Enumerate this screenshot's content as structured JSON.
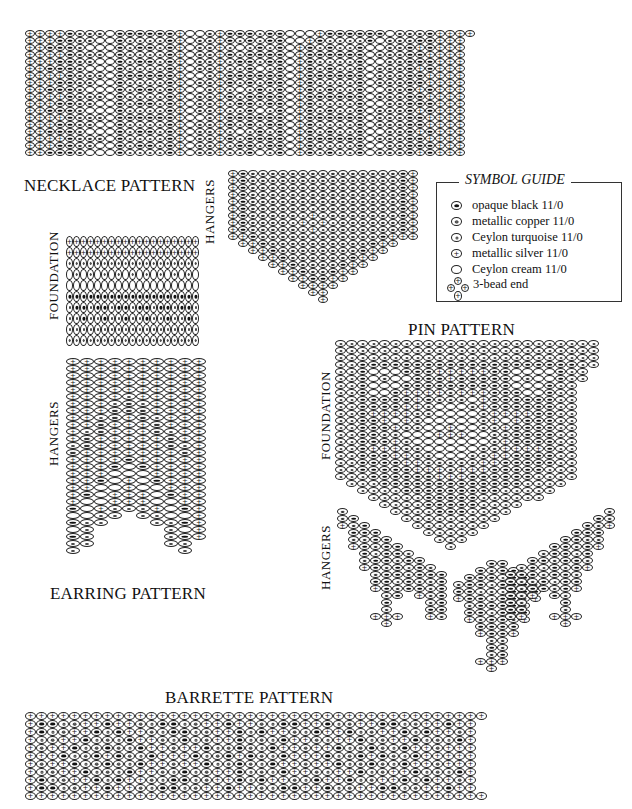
{
  "titles": {
    "necklace": "NECKLACE PATTERN",
    "earring": "EARRING PATTERN",
    "pin": "PIN PATTERN",
    "barrette": "BARRETTE PATTERN"
  },
  "side_labels": {
    "necklace_hangers": "HANGERS",
    "earring_foundation": "FOUNDATION",
    "earring_hangers": "HANGERS",
    "pin_foundation": "FOUNDATION",
    "pin_hangers": "HANGERS"
  },
  "symbol_guide": {
    "title": "SYMBOL GUIDE",
    "items": [
      {
        "code": "B",
        "label": "opaque black 11/0"
      },
      {
        "code": "C",
        "label": "metallic copper 11/0"
      },
      {
        "code": "T",
        "label": "Ceylon turquoise 11/0"
      },
      {
        "code": "S",
        "label": "metallic silver 11/0"
      },
      {
        "code": "W",
        "label": "Ceylon cream 11/0"
      },
      {
        "code": "END3",
        "label": "3-bead end"
      }
    ]
  },
  "patterns": {
    "necklace": {
      "x": 25,
      "y": 30,
      "bw": 10,
      "bh": 7,
      "rows": [
        "SSSSBCCCWBBBBBBSWWCSBBBTBBWWWSBBBBBBWCCCBSSSS",
        "SSSBBCCWWBTTTTBSWCCSBTBTBBWWSBTTTTBWCCCBBSSS",
        "SSBBBCWWWBTBBTBSWCCSTWTBTBWSBTBTTBWWCCBSBSSS",
        "SSSSBCCCWBTTTTBSWCCSBTBBBBWSBBBBBBWCCCBBSSSS",
        "SSSBBCCWWBTBBTBSWCCSTBBTBBWSBTTTTBWWCCBBBSSS",
        "SSBBBCWWWBTTTTBSWCCSTTBWTBWSBTBTTBWCCCBSBSSS",
        "SSSSBCCCWBBBBBBSWWCSBBBBBBWSBBBBBBWCCCBBSSSS",
        "SSSBBCCWWBTTTTBSWCCSBTBTBBWSBTTTTBWCCCBBSSSS",
        "SSBBBCWWWBTBBTBSWWCSTWTBTBWSBTBTTBWWCCBSBSSS",
        "SSSSBCCCWBTTTTBSWCCSBTBBBBWSBBBBBBWCCCBBSSSS",
        "SSSBBCCWWBTBBTBSWCCSTBBTBBWSBTTTTBWWCCBBBSSS",
        "SSBBBCWWWBTTTTBSWCCSTTBWTBWSBTBTTBWCCCBSBSSS",
        "SSSSBCCCWBBBBBBSWWCSBBBBBBWSBBBBBBWCCCBBSSSS",
        "SSSBBCCWWBTTTTBSWCCSBTBTBBWSBTTTTBWCCCBBSSSS",
        "SSBBBCWWWBTBBTBSWCCSTWTBTBWSBTBTTBWWCCBSBSSS",
        "SSSSBCCCWBTTTTBSWCCSBTBBBBWSBBBBBBWCCCBBSSSS",
        "SSSBBCCWWBTBBTBSWCCSTBBTBBWSBTTTTBWWCCBBBSSS",
        "SSBBBCWWWBTTTTBSWCCSTTBWTBWSBTBTTBWCCCBSBSSS"
      ]
    },
    "necklace_hangers": {
      "x": 228,
      "y": 170,
      "bw": 10,
      "bh": 7,
      "rows": [
        "SBCCCCCCCCCCCCCCCBS",
        "SBCCCCCCCCCCCCCCCBS",
        "SBCCCCCCCCCCCCCCCBS",
        "SBCCCCCCCCCCCCCCCBS",
        "SBCCCCCCCCCCCCCCCBS",
        "SBCCCCCCTCCCCCCCCBS",
        "SBCCCCCTSTCCCCCCCBS",
        "SBCCCCTSTSTCCCCCCBS",
        "SBCCCCCTSTCCCCCCCBS",
        "SSBCCCCCTCCCCCCBSSS",
        ".SSBCCCCCCCCCCBSS..",
        "..SSBCCCCCCCCBSS...",
        "...SSBCCCCCCBSS....",
        "....SSBCCCCBSS.....",
        ".....SSBCCBSS......",
        "......SSBBSS.......",
        ".......SSSS........",
        "........SS.........",
        ".........S........."
      ]
    },
    "earring_foundation": {
      "x": 66,
      "y": 236,
      "bw": 7,
      "bh": 11,
      "rows": [
        "SSSSSSSSSSSSSSSSSSS",
        "SSSSSSSSSSSSSSSSSSS",
        "CCCCCCCCCCCCCCCCCCC",
        "WCWCWCWCWCWCWCWCWCW",
        "WWWWWWWWWWWWWWWWWWW",
        "BBBBBBBBBBBBBBBBBBB",
        "TBBTBBTBBTBBTBBTBBT",
        "TTBTTBTTBTTBTTBTTBT",
        "TTTTTTTTTTTTTTTTTTT",
        "CCCCCCCCCCCCCCCCCCC"
      ]
    },
    "earring_hangers": {
      "x": 66,
      "y": 358,
      "bw": 14,
      "bh": 7,
      "rows": [
        "SSSSSSSSSS",
        "SSSSSSSSSS",
        "SSSSSSSSSS",
        "SSSSSSSSSS",
        "SSSSSSSSSS",
        "SSSSTSSSSS",
        "SSSTCTSSSS",
        "SSSCCCSSSS",
        "SSTCSCTSSS",
        "SSCSSSCSSS",
        "STCSSSCTSS",
        "SCSSSSSCSS",
        "TCSSSSSCTS",
        "CSSSSSSSCS",
        "SSSSBSSSSS",
        "SSSBWBSSSS",
        "SSSWWWSSSS",
        "SSBWSWBSSS",
        "SSWWSWWSSS",
        "SBWSSSWBSS",
        "SWWSSSWWSS",
        "BWSTTTSWBS",
        "WWTT.TTWWS",
        "BTT...TTBS",
        "WT.....TWS",
        "BT.....TBS",
        "TT.....TT.",
        "T.......T."
      ]
    },
    "pin_foundation": {
      "x": 335,
      "y": 340,
      "bw": 11,
      "bh": 7,
      "rows": [
        "TTTTTTTTTTTTTTTTTTTTTTTT",
        "TTTTTTTTTTTTTTTTTTTTTTTT",
        "TTTTTTTTTTTTTTTTTTTTTTTT",
        "TTBBBBBBBBBBBBBBBBBBBBTT",
        "TTBWWWBBBSSSSSBBWWWWBTT",
        "TTBWCWWBBBSBBBBBWCWWBTT",
        "TTBWWWBBBBBBBBBBWWWBTT",
        "TTBWWBSSSSCSSSBBBWWBTT",
        "TTBBBBBSBCCCWSBBBBBBTT",
        "TTBBBBSSCWWWCSBBBBBBTT",
        "TTBSSSSCCWWWWCSSSSBBTT",
        "TTBBSWSCWWWWWCSWSBBBTT",
        "TTBBBSCCWWSWWCCSBBBBTT",
        "TTBBCCWWWSSSWWCCBBBBTT",
        "TTBBBSCWWWWWWWCSBBBBTT",
        "TTBSSSCCWWWWWCCSSSSBTT",
        "TTBBBSSCCWWWCCSSBBBBTT",
        "TTBBBBSSCCCCCSSBBBBBTT",
        "TTBBBBBSSSCSSSBBBBBTTT",
        "TTTBBBBBBSSSBBBBBBTTTT",
        ".TTTBBBBBBBBBBBBBTTTT.",
        "..TTTTBBBBBBBBBTTTTT..",
        "...TTTTTBBBBBTTTTTT...",
        "....TTTTBBBBBTTTT.....",
        ".....TTTTBBBTTTT......",
        "......TTTTTTTTT.......",
        ".......TTTTTTT........",
        "........TTTTT.........",
        ".........TTT..........",
        "..........T..........."
      ]
    },
    "pin_hangers_left": {
      "x": 337,
      "y": 508,
      "bw": 11,
      "bh": 7,
      "rows": [
        "C.........",
        "CB........",
        "SCB.......",
        ".BBB......",
        ".CCBB.....",
        ".SBCBB....",
        "..BTBBC...",
        "..CBBCBB..",
        "..SBCBTBC.",
        "...CBBCBBB",
        "...BBTBCCB",
        "...SBCBBCB",
        "....CB.SCB",
        "....B...CB",
        "....C...BB",
        "...SSS..SC",
        "....S....."
      ]
    },
    "pin_hangers_center": {
      "x": 420,
      "y": 560,
      "bw": 11,
      "bh": 7,
      "rows": [
        "......BB......",
        ".....BCBB.....",
        "....BBBTBB....",
        "...CBBTBBBC...",
        "...BBTCTBBB...",
        "...SBBTBBCS...",
        "....CBBBBC....",
        "....BBTBBB....",
        "....SCBBCS....",
        ".....BBBB.....",
        ".....SBBS.....",
        "......CC......",
        "......BC......",
        "......CB......",
        ".....SSS......",
        "......S......."
      ]
    },
    "pin_hangers_right": {
      "x": 505,
      "y": 508,
      "bw": 11,
      "bh": 7,
      "rows": [
        ".........C",
        "........BC",
        ".......BCS",
        "......BBB.",
        ".....BBCC.",
        "....BBCBS.",
        "...CBBTB..",
        "..BBCBBC..",
        ".CBTBCBS..",
        "BBBCBBC...",
        "BCCBTBB...",
        "BCBBCBS...",
        "BCS.BC....",
        "BC...B....",
        "BB...C....",
        "CS..SSS...",
        ".....S...."
      ]
    },
    "barrette": {
      "x": 25,
      "y": 712,
      "bw": 11,
      "bh": 8,
      "rows": [
        "SSSSSSSSSSSSSSSSSSSSSSSSSSSSSSSSSSSSSSSSSS",
        "SBBTCSSBSSCTBBTCSSBSSCTBBSSBTCSSBBTCSSBSS",
        "SBTCSSBTBSSCTBBTCSSBTBSSCTBSSBTCSSBTBSSCS",
        "STCSSBTCTBSSCTBTCSSBTCTBSSCTSSBTCSSBTCTBS",
        "SCSSBTCBCTBSSCSSBTCBCTBSSCSSBTCBCTBSSCSSS",
        "SSSBTCBSBCTBSSSBTCBSBCTBSSSBTCBSBCTBSSSSS",
        "SCSSBTCBCTBSSCSSBTCBCTBSSCSSBTCBCTBSSCSSS",
        "STCSSBTCTBSSCTBTCSSBTCTBSSCTSSBTCSSBTCTBS",
        "SBTCSSBTBSSCTBBTCSSBTBSSCTBSSBTCSSBTBSSCS",
        "SBBTCSSBSSCTBBTCSSBSSCTBBSSBTCSSBBTCSSBSS",
        "SSSSSSSSSSSSSSSSSSSSSSSSSSSSSSSSSSSSSSSSSS"
      ]
    }
  }
}
